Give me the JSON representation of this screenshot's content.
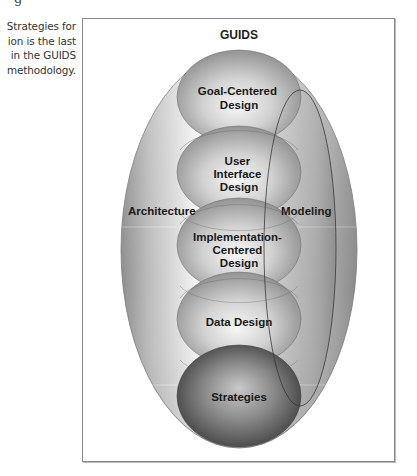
{
  "clipped_fragment": "g",
  "caption": {
    "lines": [
      "Strategies for",
      "ion is the last",
      "in the GUIDS",
      "methodology."
    ]
  },
  "diagram": {
    "title": "GUIDS",
    "outer_region": {
      "left_label": "Architecture",
      "right_label": "Modeling"
    },
    "spheres": [
      {
        "lines": [
          "Goal-Centered",
          "Design"
        ]
      },
      {
        "lines": [
          "User",
          "Interface",
          "Design"
        ]
      },
      {
        "lines": [
          "Implementation-",
          "Centered",
          "Design"
        ]
      },
      {
        "lines": [
          "Data Design"
        ]
      },
      {
        "lines": [
          "Strategies"
        ]
      }
    ],
    "colors": {
      "border": "#8a8a8a",
      "outer_light": "#f2f2f2",
      "outer_dark": "#8c8c8c",
      "sphere_light": "#f0f0f0",
      "sphere_dark": "#7a7a7a",
      "strategies_light": "#c8c8c8",
      "strategies_dark": "#3c3c3c",
      "text": "#1a1a1a"
    }
  }
}
